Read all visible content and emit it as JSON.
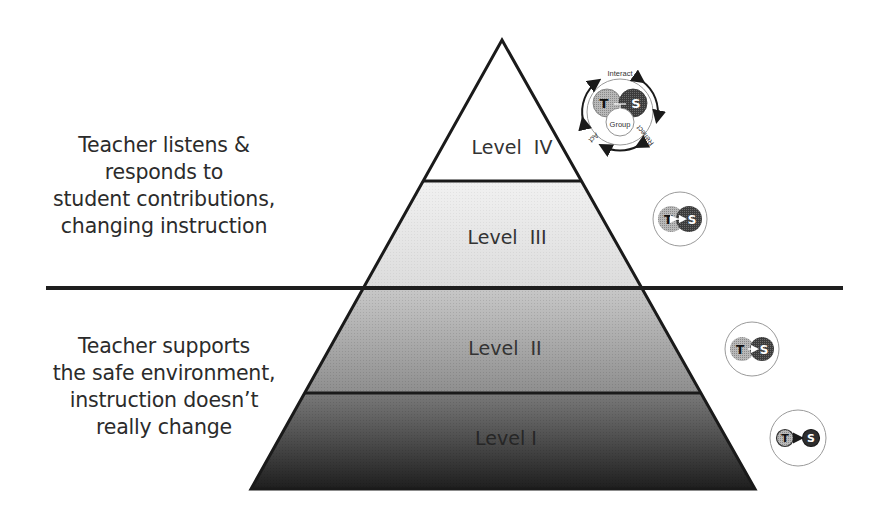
{
  "diagram": {
    "title": "",
    "pyramid": {
      "levels": [
        {
          "id": "IV",
          "label": "Level  IV",
          "fill": "#ffffff"
        },
        {
          "id": "III",
          "label": "Level  III",
          "fill": "#e6e6e6"
        },
        {
          "id": "II",
          "label": "Level  II",
          "fill": "#a9a9a9"
        },
        {
          "id": "I",
          "label": "Level I",
          "fill": "#4a4a4a"
        }
      ]
    },
    "descriptions": {
      "upper": {
        "lines": [
          "Teacher listens &",
          "responds to",
          "student contributions,",
          "changing instruction"
        ],
        "applies_to": [
          "Level III",
          "Level IV"
        ]
      },
      "lower": {
        "lines": [
          "Teacher supports",
          "the safe environment,",
          "instruction doesn’t",
          "really change"
        ],
        "applies_to": [
          "Level I",
          "Level II"
        ]
      }
    },
    "icons": {
      "level_iv": {
        "nodes": [
          "T",
          "S",
          "Group"
        ],
        "cycle_labels": {
          "top": "Interact",
          "right": "Reflect",
          "left": "Act"
        },
        "relationship": "teacher, students and group interact in a cycle"
      },
      "level_iii": {
        "nodes": [
          "T",
          "S"
        ],
        "arrow": "bidirectional",
        "relationship": "T ↔ S, overlapping"
      },
      "level_ii": {
        "nodes": [
          "T",
          "S"
        ],
        "arrow": "one-way",
        "relationship": "T → S, overlapping"
      },
      "level_i": {
        "nodes": [
          "T",
          "S"
        ],
        "arrow": "one-way",
        "relationship": "T → S, separate"
      }
    },
    "colors": {
      "outline": "#1a1a1a",
      "teacher_circle": "#a8a8a8",
      "student_circle": "#3a3a3a",
      "text": "#2b2b2b"
    }
  }
}
